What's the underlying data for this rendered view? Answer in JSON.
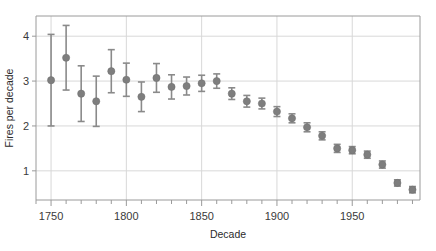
{
  "chart_data": {
    "type": "scatter",
    "title": "",
    "xlabel": "Decade",
    "ylabel": "Fires per decade",
    "xlim": [
      1740,
      1995
    ],
    "ylim": [
      0.35,
      4.45
    ],
    "grid": true,
    "legend": null,
    "x_ticks": [
      1750,
      1800,
      1850,
      1900,
      1950
    ],
    "x_tick_labels": [
      "1750",
      "1800",
      "1850",
      "1900",
      "1950"
    ],
    "x_minor_tick_step": 10,
    "y_ticks": [
      1,
      2,
      3,
      4
    ],
    "y_tick_labels": [
      "1",
      "2",
      "3",
      "4"
    ],
    "marker_color": "#7e7e7e",
    "errorbar_color": "#8a8a8a",
    "grid_color": "#d8d8d8",
    "axis_color": "#9a9a9a",
    "series": [
      {
        "name": "Fires per decade",
        "x": [
          1750,
          1760,
          1770,
          1780,
          1790,
          1800,
          1810,
          1820,
          1830,
          1840,
          1850,
          1860,
          1870,
          1880,
          1890,
          1900,
          1910,
          1920,
          1930,
          1940,
          1950,
          1960,
          1970,
          1980,
          1990
        ],
        "values": [
          3.02,
          3.52,
          2.72,
          2.55,
          3.22,
          3.03,
          2.65,
          3.07,
          2.87,
          2.89,
          2.95,
          3.0,
          2.72,
          2.55,
          2.5,
          2.32,
          2.17,
          1.97,
          1.78,
          1.5,
          1.46,
          1.36,
          1.14,
          0.73,
          0.58
        ],
        "err_low": [
          1.02,
          0.72,
          0.62,
          0.56,
          0.48,
          0.37,
          0.33,
          0.32,
          0.27,
          0.2,
          0.18,
          0.16,
          0.13,
          0.13,
          0.12,
          0.11,
          0.1,
          0.1,
          0.09,
          0.09,
          0.08,
          0.08,
          0.08,
          0.07,
          0.07
        ],
        "err_high": [
          1.02,
          0.72,
          0.62,
          0.56,
          0.48,
          0.37,
          0.33,
          0.32,
          0.27,
          0.2,
          0.18,
          0.16,
          0.13,
          0.13,
          0.12,
          0.11,
          0.1,
          0.1,
          0.09,
          0.09,
          0.08,
          0.08,
          0.08,
          0.07,
          0.07
        ]
      }
    ]
  }
}
